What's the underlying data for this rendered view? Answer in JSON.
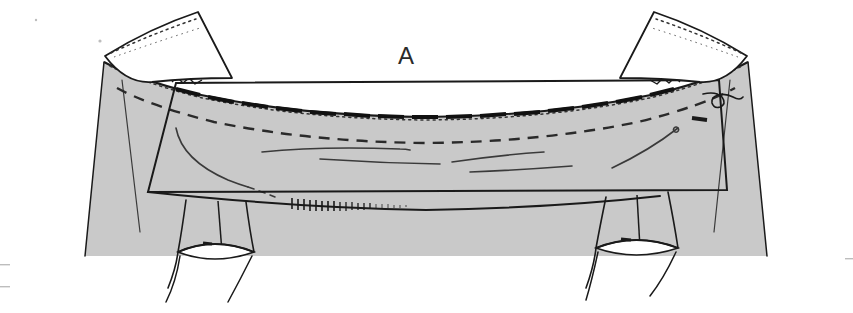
{
  "figure": {
    "label": "A",
    "caption_letter": "A",
    "medium": "grayscale line drawing",
    "background_color": "#ffffff",
    "fill_gray": "#c9c9c9",
    "fill_gray_light": "#d2d2d2",
    "ink_color": "#1a1a1a",
    "ink_color_soft": "#3a3a3a",
    "white_flap_fill": "#ffffff"
  },
  "parts": {
    "body_shading": {
      "name": "shaded-trapezoid-body",
      "fill": "#c9c9c9",
      "description": "large light gray trapezoidal field spanning the figure"
    },
    "top_curve": {
      "name": "upper-arched-margin",
      "stroke": "#1a1a1a",
      "description": "concave arched upper edge of the shaded body"
    },
    "dashed_curve": {
      "name": "dashed-arc-line",
      "stroke": "#2a2a2a",
      "dash": "11 8",
      "description": "long dashed arc running parallel beneath the arched margin"
    },
    "dotted_curve": {
      "name": "dotted-arc-line",
      "stroke": "#333333",
      "dash": "2 4",
      "description": "fine dotted arc following the outer arched margin"
    },
    "clip_row": {
      "name": "toothed-clip-row",
      "stroke": "#111111",
      "count": 15,
      "description": "row of short dark segmented clips along the arched margin"
    },
    "overlay_rect": {
      "name": "overlay-rectangle-frame",
      "stroke": "#1a1a1a",
      "description": "tilted rectangular outline framing the central region"
    },
    "flap_left": {
      "name": "white-flap-left",
      "fill": "#ffffff",
      "stroke": "#1a1a1a",
      "description": "reflected white quadrilateral flap at upper left with dotted inner edge"
    },
    "flap_right": {
      "name": "white-flap-right",
      "fill": "#ffffff",
      "stroke": "#1a1a1a",
      "description": "reflected white quadrilateral flap at upper right with dotted inner edge"
    },
    "tube_left": {
      "name": "tubular-structure-left",
      "stroke": "#1a1a1a",
      "description": "cylindrical tube descending below the body at lower left"
    },
    "tube_right": {
      "name": "tubular-structure-right",
      "stroke": "#1a1a1a",
      "description": "cylindrical tube descending below the body at lower right"
    },
    "hatch_line": {
      "name": "comb-hatched-edge",
      "stroke": "#1a1a1a",
      "description": "short comb-like hatch marks along lower center boundary"
    },
    "hook_squiggle": {
      "name": "hook-squiggle-mark",
      "stroke": "#1a1a1a",
      "description": "small curled hook shape near upper right of the frame"
    },
    "tick_mark": {
      "name": "short-tick-mark",
      "stroke": "#1a1a1a",
      "description": "short thick dash inside the right edge of the frame"
    },
    "interior_lines": {
      "name": "interior-contour-lines",
      "stroke": "#3a3a3a",
      "count": 7,
      "description": "faint sweeping contour strokes inside the shaded body"
    }
  }
}
